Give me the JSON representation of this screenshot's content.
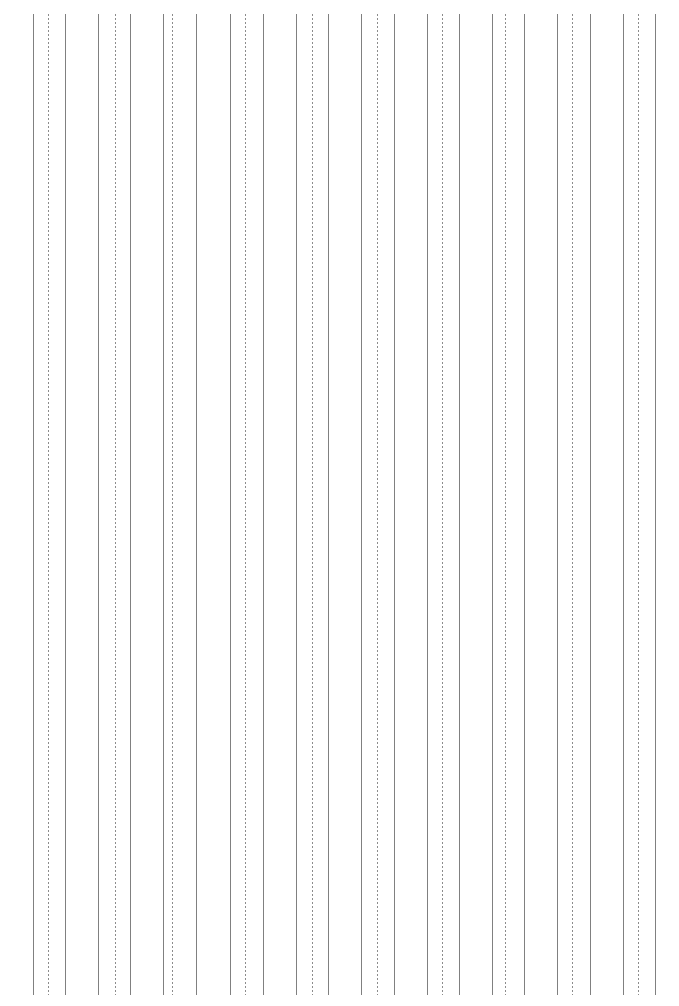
{
  "page": {
    "width": 679,
    "height": 1006,
    "background_color": "#ffffff"
  },
  "chart_data": {
    "type": "line",
    "title": "",
    "subtitle": "",
    "xlabel": "",
    "ylabel": "",
    "grid": false,
    "legend": "none",
    "orientation": "vertical",
    "line_top_y": 14,
    "line_bottom_y": 995,
    "line_height": 981,
    "stroke_width": 1,
    "solid_color": "#808080",
    "dotted_color": "#8c8c8c",
    "group_count": 10,
    "group_pattern": [
      "solid",
      "dotted",
      "solid"
    ],
    "group_pitch": 65,
    "annotations": [],
    "tick_labels": [],
    "x": [
      33,
      48,
      65,
      98,
      115,
      130,
      163,
      172,
      196,
      230,
      245,
      263,
      296,
      312,
      328,
      361,
      377,
      394,
      427,
      442,
      459,
      492,
      505,
      524,
      557,
      572,
      590,
      623,
      638,
      655
    ],
    "lines": [
      {
        "x": 33,
        "style": "solid",
        "group": 1
      },
      {
        "x": 48,
        "style": "dotted",
        "group": 1
      },
      {
        "x": 65,
        "style": "solid",
        "group": 1
      },
      {
        "x": 98,
        "style": "solid",
        "group": 2
      },
      {
        "x": 115,
        "style": "dotted",
        "group": 2
      },
      {
        "x": 130,
        "style": "solid",
        "group": 2
      },
      {
        "x": 163,
        "style": "solid",
        "group": 3
      },
      {
        "x": 172,
        "style": "dotted",
        "group": 3
      },
      {
        "x": 196,
        "style": "solid",
        "group": 3
      },
      {
        "x": 230,
        "style": "solid",
        "group": 4
      },
      {
        "x": 245,
        "style": "dotted",
        "group": 4
      },
      {
        "x": 263,
        "style": "solid",
        "group": 4
      },
      {
        "x": 296,
        "style": "solid",
        "group": 5
      },
      {
        "x": 312,
        "style": "dotted",
        "group": 5
      },
      {
        "x": 328,
        "style": "solid",
        "group": 5
      },
      {
        "x": 361,
        "style": "solid",
        "group": 6
      },
      {
        "x": 377,
        "style": "dotted",
        "group": 6
      },
      {
        "x": 394,
        "style": "solid",
        "group": 6
      },
      {
        "x": 427,
        "style": "solid",
        "group": 7
      },
      {
        "x": 442,
        "style": "dotted",
        "group": 7
      },
      {
        "x": 459,
        "style": "solid",
        "group": 7
      },
      {
        "x": 492,
        "style": "solid",
        "group": 8
      },
      {
        "x": 505,
        "style": "dotted",
        "group": 8
      },
      {
        "x": 524,
        "style": "solid",
        "group": 8
      },
      {
        "x": 557,
        "style": "solid",
        "group": 9
      },
      {
        "x": 572,
        "style": "dotted",
        "group": 9
      },
      {
        "x": 590,
        "style": "solid",
        "group": 9
      },
      {
        "x": 623,
        "style": "solid",
        "group": 10
      },
      {
        "x": 638,
        "style": "dotted",
        "group": 10
      },
      {
        "x": 655,
        "style": "solid",
        "group": 10
      }
    ]
  }
}
